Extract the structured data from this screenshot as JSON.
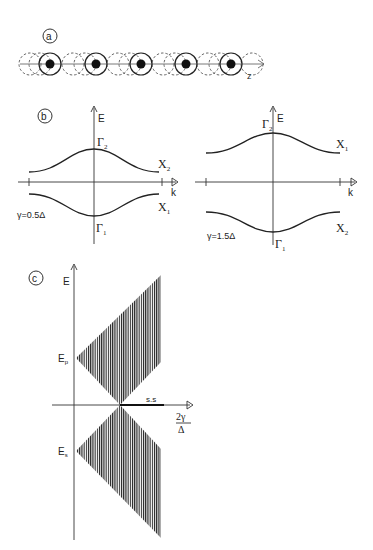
{
  "panels": {
    "a": {
      "label": "a",
      "axis_label": "z",
      "atom_count": 5,
      "atom_centers_x": [
        50,
        96,
        141,
        186,
        231
      ],
      "dashed_centers_x": [
        27,
        73,
        118,
        163,
        208,
        254
      ]
    },
    "b_left": {
      "label": "b",
      "e_label": "E",
      "k_label": "k",
      "top_point": "Γ",
      "top_sub": "2",
      "bottom_point": "Γ",
      "bottom_sub": "1",
      "upper_band_end": "X",
      "upper_band_sub": "2",
      "lower_band_end": "X",
      "lower_band_sub": "1",
      "gamma_label": "γ=0.5Δ"
    },
    "b_right": {
      "e_label": "E",
      "k_label": "k",
      "top_point": "Γ",
      "top_sub": "2",
      "bottom_point": "Γ",
      "bottom_sub": "1",
      "upper_band_end": "X",
      "upper_band_sub": "1",
      "lower_band_end": "X",
      "lower_band_sub": "2",
      "gamma_label": "γ=1.5Δ"
    },
    "c": {
      "label": "c",
      "e_label": "E",
      "ep_label": "E",
      "ep_sub": "p",
      "es_label": "E",
      "es_sub": "s",
      "ss_label": "s.s",
      "x_label_num": "2γ",
      "x_label_den": "Δ"
    }
  },
  "colors": {
    "ink": "#222222",
    "background": "#ffffff"
  }
}
